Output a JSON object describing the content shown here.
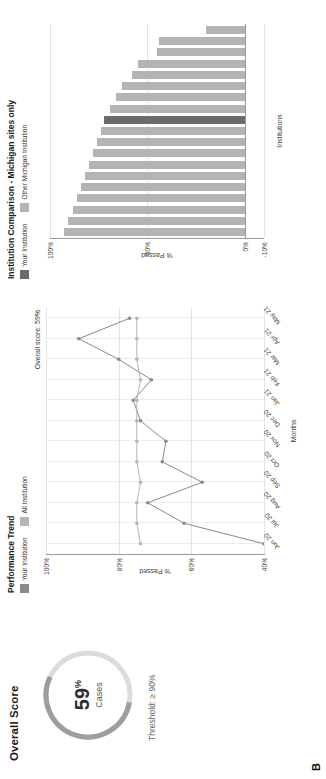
{
  "gauge": {
    "title": "Overall Score",
    "value": "59",
    "value_unit": "%",
    "sublabel": "Cases",
    "threshold": "Threshold: ≥ 90%",
    "arc_color": "#9e9e9e",
    "track_color": "#dcdcdc",
    "percent": 59
  },
  "line_chart": {
    "title": "Performance Trend",
    "annotation": "Overall score: 59%",
    "legend": [
      {
        "label": "Your Institution",
        "color": "#8a8a8a"
      },
      {
        "label": "All Institution",
        "color": "#b5b5b5"
      }
    ],
    "xlabel": "Months",
    "ylabel": "% Passed",
    "yticks": [
      "100%",
      "80%",
      "60%",
      "40%"
    ],
    "xticks": [
      "Jun 20",
      "Jul 20",
      "Aug 20",
      "Sep 20",
      "Oct 20",
      "Nov 20",
      "Dec 20",
      "Jan 21",
      "Feb 21",
      "Mar 21",
      "Apr 21",
      "May 21"
    ]
  },
  "bar_chart": {
    "title": "Institution Comparison - Michigan sites only",
    "legend": [
      {
        "label": "Your Institution",
        "color": "#6b6b6b"
      },
      {
        "label": "Other Michigan Institution",
        "color": "#b3b3b3"
      }
    ],
    "xlabel": "Institutions",
    "ylabel": "% Passed",
    "yticks": [
      "100%",
      "50%",
      "0%",
      "-10%"
    ]
  },
  "panel_letter": "B",
  "chart_data": [
    {
      "type": "line",
      "title": "Performance Trend",
      "xlabel": "Months",
      "ylabel": "% Passed",
      "x": [
        "Jun 20",
        "Jul 20",
        "Aug 20",
        "Sep 20",
        "Oct 20",
        "Nov 20",
        "Dec 20",
        "Jan 21",
        "Feb 21",
        "Mar 21",
        "Apr 21",
        "May 21"
      ],
      "ylim": [
        40,
        100
      ],
      "yticks": [
        40,
        60,
        80,
        100
      ],
      "grid": true,
      "legend_position": "top-left",
      "annotation": "Overall score: 59%",
      "series": [
        {
          "name": "Your Institution",
          "color": "#8a8a8a",
          "values": [
            40,
            62,
            72,
            57,
            68,
            67,
            74,
            76,
            71,
            80,
            91,
            77
          ]
        },
        {
          "name": "All Institution",
          "color": "#b5b5b5",
          "values": [
            74,
            75,
            75,
            74,
            75,
            75,
            75,
            75,
            74,
            75,
            75,
            75
          ]
        }
      ]
    },
    {
      "type": "bar",
      "title": "Institution Comparison - Michigan sites only",
      "xlabel": "Institutions",
      "ylabel": "% Passed",
      "ylim": [
        -10,
        100
      ],
      "yticks": [
        -10,
        0,
        50,
        100
      ],
      "grid": true,
      "legend_position": "top-left",
      "categories": [
        "1",
        "2",
        "3",
        "4",
        "5",
        "6",
        "7",
        "8",
        "9",
        "10",
        "11",
        "12",
        "13",
        "14",
        "15",
        "16",
        "17",
        "18",
        "19"
      ],
      "values": [
        93,
        91,
        88,
        86,
        84,
        82,
        80,
        78,
        76,
        74,
        72,
        69,
        66,
        63,
        58,
        55,
        45,
        44,
        20
      ],
      "highlight_index": 10,
      "highlight_label": "Your Institution",
      "bar_color": "#b3b3b3",
      "highlight_color": "#6b6b6b"
    }
  ]
}
